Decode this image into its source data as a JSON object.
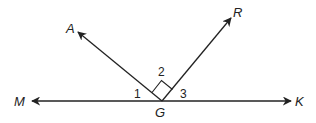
{
  "diagram": {
    "type": "geometry-angles",
    "colors": {
      "stroke": "#222222",
      "background": "#ffffff"
    },
    "points": {
      "M": {
        "label": "M"
      },
      "K": {
        "label": "K"
      },
      "G": {
        "label": "G"
      },
      "A": {
        "label": "A"
      },
      "R": {
        "label": "R"
      }
    },
    "angles": {
      "a1": {
        "label": "1",
        "between": "MG-GA"
      },
      "a2": {
        "label": "2",
        "between": "GA-GR",
        "right_angle": true
      },
      "a3": {
        "label": "3",
        "between": "GR-GK"
      }
    },
    "lines": [
      {
        "name": "line-MK",
        "through": "G",
        "arrows": "both"
      },
      {
        "name": "ray-GA",
        "from": "G",
        "to": "A"
      },
      {
        "name": "ray-GR",
        "from": "G",
        "to": "R"
      }
    ]
  }
}
